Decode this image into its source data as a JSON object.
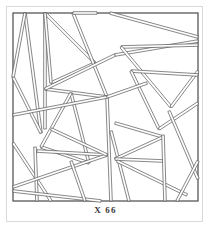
{
  "figure": {
    "caption": "X 66",
    "type": "line-art-plate",
    "frame": {
      "shape": "square",
      "stroke_color": "#4a4a4a",
      "stroke_width": 1
    },
    "style": {
      "background_color": "#ffffff",
      "line_color": "#555555",
      "band_fill": "#ffffff",
      "band_width_px": 2.6,
      "page_border_color": "#d9d9d9"
    },
    "geometry": {
      "viewbox": [
        0,
        0,
        189,
        192
      ],
      "frame_rect": [
        2,
        2,
        185,
        188
      ],
      "bands": [
        {
          "name": "band-1",
          "x1": 14,
          "y1": 2,
          "x2": 30,
          "y2": 122
        },
        {
          "name": "band-2",
          "x1": 30,
          "y1": 122,
          "x2": 2,
          "y2": 66
        },
        {
          "name": "band-3",
          "x1": 2,
          "y1": 66,
          "x2": 14,
          "y2": 2
        },
        {
          "name": "band-4",
          "x1": 34,
          "y1": 2,
          "x2": 34,
          "y2": 118
        },
        {
          "name": "band-5",
          "x1": 34,
          "y1": 2,
          "x2": 84,
          "y2": 52
        },
        {
          "name": "band-6",
          "x1": 84,
          "y1": 52,
          "x2": 40,
          "y2": 72
        },
        {
          "name": "band-7",
          "x1": 40,
          "y1": 72,
          "x2": 34,
          "y2": 2
        },
        {
          "name": "band-8",
          "x1": 62,
          "y1": 2,
          "x2": 96,
          "y2": 86
        },
        {
          "name": "band-9",
          "x1": 96,
          "y1": 86,
          "x2": 34,
          "y2": 78
        },
        {
          "name": "band-10",
          "x1": 34,
          "y1": 78,
          "x2": 104,
          "y2": 44
        },
        {
          "name": "band-11",
          "x1": 104,
          "y1": 44,
          "x2": 187,
          "y2": 30
        },
        {
          "name": "band-12",
          "x1": 99,
          "y1": 2,
          "x2": 187,
          "y2": 26
        },
        {
          "name": "band-13",
          "x1": 110,
          "y1": 36,
          "x2": 187,
          "y2": 34
        },
        {
          "name": "band-14",
          "x1": 110,
          "y1": 36,
          "x2": 160,
          "y2": 96
        },
        {
          "name": "band-15",
          "x1": 160,
          "y1": 96,
          "x2": 187,
          "y2": 60
        },
        {
          "name": "band-16",
          "x1": 120,
          "y1": 60,
          "x2": 187,
          "y2": 64
        },
        {
          "name": "band-17",
          "x1": 120,
          "y1": 60,
          "x2": 148,
          "y2": 118
        },
        {
          "name": "band-18",
          "x1": 148,
          "y1": 118,
          "x2": 187,
          "y2": 92
        },
        {
          "name": "band-19",
          "x1": 96,
          "y1": 86,
          "x2": 100,
          "y2": 190
        },
        {
          "name": "band-20",
          "x1": 60,
          "y1": 82,
          "x2": 78,
          "y2": 152
        },
        {
          "name": "band-21",
          "x1": 78,
          "y1": 152,
          "x2": 30,
          "y2": 136
        },
        {
          "name": "band-22",
          "x1": 30,
          "y1": 136,
          "x2": 60,
          "y2": 82
        },
        {
          "name": "band-23",
          "x1": 2,
          "y1": 104,
          "x2": 96,
          "y2": 86
        },
        {
          "name": "band-24",
          "x1": 2,
          "y1": 132,
          "x2": 40,
          "y2": 190
        },
        {
          "name": "band-25",
          "x1": 24,
          "y1": 136,
          "x2": 26,
          "y2": 190
        },
        {
          "name": "band-26",
          "x1": 26,
          "y1": 140,
          "x2": 96,
          "y2": 144
        },
        {
          "name": "band-27",
          "x1": 2,
          "y1": 176,
          "x2": 96,
          "y2": 144
        },
        {
          "name": "band-28",
          "x1": 2,
          "y1": 180,
          "x2": 90,
          "y2": 190
        },
        {
          "name": "band-29",
          "x1": 60,
          "y1": 150,
          "x2": 74,
          "y2": 190
        },
        {
          "name": "band-30",
          "x1": 100,
          "y1": 120,
          "x2": 118,
          "y2": 190
        },
        {
          "name": "band-31",
          "x1": 104,
          "y1": 112,
          "x2": 152,
          "y2": 126
        },
        {
          "name": "band-32",
          "x1": 104,
          "y1": 148,
          "x2": 152,
          "y2": 126
        },
        {
          "name": "band-33",
          "x1": 104,
          "y1": 148,
          "x2": 152,
          "y2": 150
        },
        {
          "name": "band-34",
          "x1": 106,
          "y1": 150,
          "x2": 176,
          "y2": 184
        },
        {
          "name": "band-35",
          "x1": 152,
          "y1": 124,
          "x2": 154,
          "y2": 190
        },
        {
          "name": "band-36",
          "x1": 158,
          "y1": 100,
          "x2": 187,
          "y2": 168
        },
        {
          "name": "band-37",
          "x1": 166,
          "y1": 190,
          "x2": 187,
          "y2": 150
        },
        {
          "name": "band-38",
          "x1": 96,
          "y1": 86,
          "x2": 136,
          "y2": 72
        },
        {
          "name": "band-39",
          "x1": 40,
          "y1": 118,
          "x2": 96,
          "y2": 144
        },
        {
          "name": "band-40",
          "x1": 86,
          "y1": 2,
          "x2": 62,
          "y2": 2
        }
      ]
    }
  }
}
